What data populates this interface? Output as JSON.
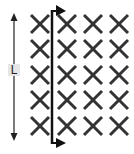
{
  "diagram": {
    "type": "magnetic-field-rod",
    "field": {
      "symbol": "×",
      "direction": "into-page",
      "rows": 5,
      "cols": 4
    },
    "rod": {
      "orientation": "vertical",
      "velocity_direction": "right"
    },
    "dimension": {
      "label": "L"
    },
    "colors": {
      "ink": "#222222",
      "background": "#ffffff",
      "label_bg": "#e6e6e6"
    }
  }
}
